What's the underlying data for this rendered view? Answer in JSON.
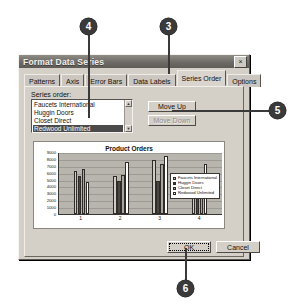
{
  "dialog": {
    "title": "Format Data Series",
    "close_icon": "close-icon",
    "close_label": "×",
    "tabs": [
      {
        "label": "Patterns",
        "active": false
      },
      {
        "label": "Axis",
        "active": false
      },
      {
        "label": "Error Bars",
        "active": false
      },
      {
        "label": "Data Labels",
        "active": false
      },
      {
        "label": "Series Order",
        "active": true
      },
      {
        "label": "Options",
        "active": false
      }
    ],
    "series_order": {
      "label": "Series order:",
      "items": [
        {
          "label": "Faucets International",
          "selected": false
        },
        {
          "label": "Huggin Doors",
          "selected": false
        },
        {
          "label": "Closet Direct",
          "selected": false
        },
        {
          "label": "Redwood Unlimited",
          "selected": true
        }
      ],
      "scroll_up_glyph": "▲",
      "scroll_down_glyph": "▼"
    },
    "buttons": {
      "move_up": "Move Up",
      "move_up_accel": "U",
      "move_down": "Move Down",
      "move_down_enabled": false,
      "ok": "OK",
      "cancel": "Cancel"
    }
  },
  "chart_data": {
    "type": "bar",
    "title": "Product Orders",
    "xlabel": "",
    "ylabel": "",
    "ylim": [
      0,
      9000
    ],
    "yticks": [
      9000,
      8000,
      7000,
      6000,
      5000,
      4000,
      3000,
      2000,
      1000,
      0
    ],
    "categories": [
      "1",
      "2",
      "3",
      "4"
    ],
    "grid": true,
    "legend_position": "right",
    "series": [
      {
        "name": "Faucets International",
        "color": "#cfcbc5",
        "values": [
          6300,
          5500,
          7900,
          5300
        ]
      },
      {
        "name": "Huggin Doors",
        "color": "#4a4743",
        "values": [
          5500,
          4800,
          4800,
          4600
        ]
      },
      {
        "name": "Closet Direct",
        "color": "#a8a49e",
        "values": [
          6500,
          5700,
          7300,
          5400
        ]
      },
      {
        "name": "Redwood Unlimited",
        "color": "#ffffff",
        "values": [
          4700,
          7500,
          8400,
          7300
        ]
      }
    ]
  },
  "callouts": [
    {
      "number": "3"
    },
    {
      "number": "4"
    },
    {
      "number": "5"
    },
    {
      "number": "6"
    }
  ]
}
